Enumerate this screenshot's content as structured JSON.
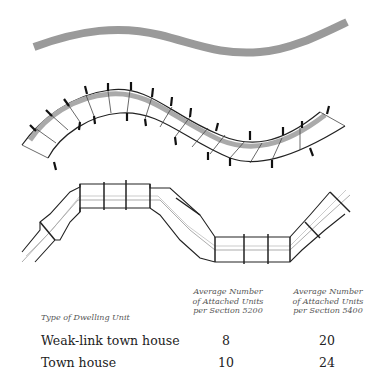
{
  "figure": {
    "panels": [
      {
        "name": "site-curve",
        "description": "gray curved band"
      },
      {
        "name": "weak-link-town-house-plan",
        "description": "curved attached units"
      },
      {
        "name": "town-house-plan",
        "description": "angular attached units"
      }
    ]
  },
  "table": {
    "col0_header": "Type of Dwelling Unit",
    "col1_header": [
      "Average Number",
      "of Attached Units",
      "per Section 5200"
    ],
    "col2_header": [
      "Average Number",
      "of Attached Units",
      "per Section 5400"
    ],
    "rows": [
      {
        "type": "Weak-link town house",
        "s5200": "8",
        "s5400": "20"
      },
      {
        "type": "Town house",
        "s5200": "10",
        "s5400": "24"
      }
    ]
  }
}
